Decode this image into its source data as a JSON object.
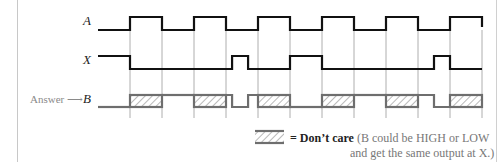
{
  "diagram": {
    "signals": [
      {
        "name": "A",
        "label": "A"
      },
      {
        "name": "X",
        "label": "X"
      },
      {
        "name": "B",
        "label": "B"
      }
    ],
    "answer_label": "Answer",
    "answer_arrow": "⟶",
    "time_intervals": 12,
    "waveforms": {
      "A": [
        0,
        1,
        1,
        0,
        0,
        1,
        1,
        0,
        0,
        1,
        1,
        0,
        0,
        1,
        1,
        0,
        0,
        1,
        1,
        0,
        0,
        1,
        1,
        1
      ],
      "X_segments": [
        {
          "t0": 0,
          "t1": 1,
          "level": 1
        },
        {
          "t0": 1,
          "t1": 4.19,
          "level": 0
        },
        {
          "t0": 4.19,
          "t1": 4.69,
          "level": 1
        },
        {
          "t0": 4.69,
          "t1": 6,
          "level": 0
        },
        {
          "t0": 6,
          "t1": 7,
          "level": 1
        },
        {
          "t0": 7,
          "t1": 10.5,
          "level": 0
        },
        {
          "t0": 10.5,
          "t1": 11,
          "level": 1
        },
        {
          "t0": 11,
          "t1": 12,
          "level": 0
        }
      ],
      "B_segments": [
        {
          "t0": 0,
          "t1": 1,
          "level": "low"
        },
        {
          "t0": 1,
          "t1": 2,
          "level": "dont-care"
        },
        {
          "t0": 2,
          "t1": 3,
          "level": "high"
        },
        {
          "t0": 3,
          "t1": 4,
          "level": "dont-care"
        },
        {
          "t0": 4,
          "t1": 4.19,
          "level": "high"
        },
        {
          "t0": 4.19,
          "t1": 4.69,
          "level": "low"
        },
        {
          "t0": 4.69,
          "t1": 5,
          "level": "high"
        },
        {
          "t0": 5,
          "t1": 6,
          "level": "dont-care"
        },
        {
          "t0": 6,
          "t1": 7,
          "level": "low"
        },
        {
          "t0": 7,
          "t1": 8,
          "level": "dont-care"
        },
        {
          "t0": 8,
          "t1": 9,
          "level": "high"
        },
        {
          "t0": 9,
          "t1": 10,
          "level": "dont-care"
        },
        {
          "t0": 10,
          "t1": 10.5,
          "level": "high"
        },
        {
          "t0": 10.5,
          "t1": 11,
          "level": "low"
        },
        {
          "t0": 11,
          "t1": 12,
          "level": "dont-care"
        }
      ]
    },
    "legend": {
      "symbol": "hatched-box",
      "equals": "= Don’t care",
      "note_line1": "(B could be HIGH or LOW",
      "note_line2": "and get the same output at X.)"
    },
    "colors": {
      "signal": "#111111",
      "answer_signal": "#6e6e6e",
      "grid": "#9a9a9a"
    }
  }
}
